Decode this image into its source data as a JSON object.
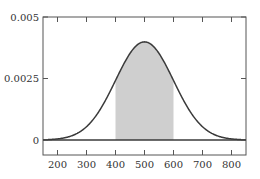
{
  "chart_data": {
    "type": "area",
    "title": "",
    "xlabel": "",
    "ylabel": "",
    "distribution": {
      "mean": 500,
      "sd": 100
    },
    "shaded_interval": [
      400,
      600
    ],
    "xlim": [
      150,
      850
    ],
    "ylim": [
      0,
      0.005
    ],
    "x_ticks": [
      200,
      300,
      400,
      500,
      600,
      700,
      800
    ],
    "x_tick_labels": [
      "200",
      "300",
      "400",
      "500",
      "600",
      "700",
      "800"
    ],
    "y_ticks": [
      0,
      0.0025,
      0.005
    ],
    "y_tick_labels": [
      "0",
      "0.0025",
      "0.005"
    ],
    "x": [
      150,
      200,
      250,
      300,
      350,
      400,
      450,
      500,
      550,
      600,
      650,
      700,
      750,
      800,
      850
    ],
    "series": [
      {
        "name": "density",
        "values": [
          8.7e-06,
          4.43e-05,
          0.0001753,
          0.0005399,
          0.0012952,
          0.0024197,
          0.0035207,
          0.0039894,
          0.0035207,
          0.0024197,
          0.0012952,
          0.0005399,
          0.0001753,
          4.43e-05,
          8.7e-06
        ]
      }
    ],
    "grid": false,
    "legend": null
  },
  "colors": {
    "curve": "#3a3a3a",
    "shade": "#cfcfcf",
    "axis": "#555555",
    "text": "#333333"
  }
}
